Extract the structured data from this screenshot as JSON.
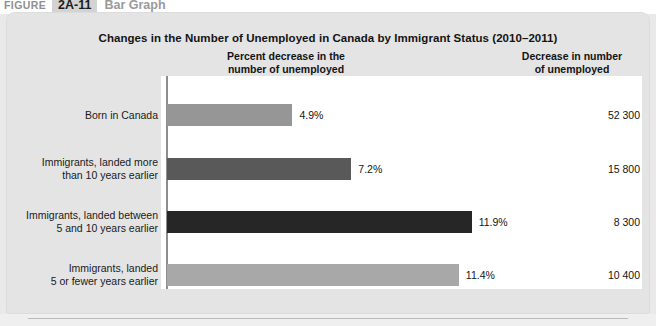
{
  "figure_header": {
    "word": "FIGURE",
    "number": "2A-11",
    "kind": "Bar Graph"
  },
  "chart_title": "Changes in the Number of Unemployed in Canada by Immigrant Status (2010–2011)",
  "column_headers": {
    "left": "Percent decrease in the\nnumber of unemployed",
    "left_line1": "Percent decrease in the",
    "left_line2": "number of unemployed",
    "right_line1": "Decrease in number",
    "right_line2": "of unemployed"
  },
  "rows": [
    {
      "label_line1": "Born in Canada",
      "label_line2": "",
      "percent_label": "4.9%",
      "percent_value": 4.9,
      "count_label": "52 300",
      "count_value": 52300,
      "bar_color": "#969696"
    },
    {
      "label_line1": "Immigrants, landed more",
      "label_line2": "than 10 years earlier",
      "percent_label": "7.2%",
      "percent_value": 7.2,
      "count_label": "15 800",
      "count_value": 15800,
      "bar_color": "#595959"
    },
    {
      "label_line1": "Immigrants, landed between",
      "label_line2": "5 and 10 years earlier",
      "percent_label": "11.9%",
      "percent_value": 11.9,
      "count_label": "8 300",
      "count_value": 8300,
      "bar_color": "#262626"
    },
    {
      "label_line1": "Immigrants, landed",
      "label_line2": "5 or fewer years earlier",
      "percent_label": "11.4%",
      "percent_value": 11.4,
      "count_label": "10 400",
      "count_value": 10400,
      "bar_color": "#a8a8a8"
    }
  ],
  "chart_data": {
    "type": "bar",
    "orientation": "horizontal",
    "title": "Changes in the Number of Unemployed in Canada by Immigrant Status (2010–2011)",
    "xlabel": "Percent decrease in the number of unemployed",
    "ylabel": "",
    "categories": [
      "Born in Canada",
      "Immigrants, landed more than 10 years earlier",
      "Immigrants, landed between 5 and 10 years earlier",
      "Immigrants, landed 5 or fewer years earlier"
    ],
    "values": [
      4.9,
      7.2,
      11.9,
      11.4
    ],
    "value_labels": [
      "4.9%",
      "7.2%",
      "11.9%",
      "11.4%"
    ],
    "secondary_column_label": "Decrease in number of unemployed",
    "secondary_values": [
      52300,
      15800,
      8300,
      10400
    ],
    "secondary_value_labels": [
      "52 300",
      "15 800",
      "8 300",
      "10 400"
    ],
    "bar_colors": [
      "#969696",
      "#595959",
      "#262626",
      "#a8a8a8"
    ],
    "xlim": [
      0,
      12
    ],
    "grid": false,
    "legend": "none"
  },
  "layout": {
    "px_per_percent": 25.6,
    "row_tops": [
      104,
      158,
      211,
      264
    ]
  }
}
